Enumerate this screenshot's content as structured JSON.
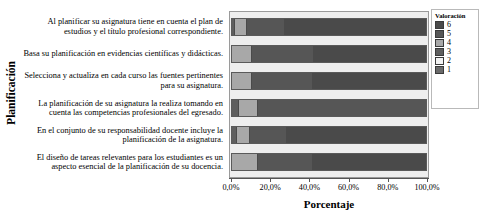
{
  "chart_data": {
    "type": "bar",
    "orientation": "horizontal",
    "stacked": true,
    "normalized": true,
    "title": "",
    "xlabel": "Porcentaje",
    "ylabel": "Planificación",
    "xlim": [
      0,
      100
    ],
    "xticks": [
      0,
      20,
      40,
      60,
      80,
      100
    ],
    "xticklabels": [
      "0,0%",
      "20,0%",
      "40,0%",
      "60,0%",
      "80,0%",
      "100,0%"
    ],
    "grid": false,
    "legend": {
      "title": "Valoración",
      "position": "right",
      "entries": [
        {
          "label": "6",
          "color": "#4a4a4a"
        },
        {
          "label": "5",
          "color": "#565656"
        },
        {
          "label": "4",
          "color": "#a8a8a8"
        },
        {
          "label": "3",
          "color": "#5e5e5e"
        },
        {
          "label": "2",
          "color": "#f2f2f2"
        },
        {
          "label": "1",
          "color": "#6a6a6a"
        }
      ]
    },
    "categories": [
      "Al planificar su asignatura tiene en cuenta el plan de estudios y el título profesional correspondiente.",
      "Basa su planificación en evidencias científicas y didácticas.",
      "Selecciona y actualiza en cada curso las fuentes pertinentes para su asignatura.",
      "La planificación de su asignatura la realiza tomando en cuenta las competencias profesionales del egresado.",
      "En el conjunto de su responsabilidad docente incluye la planificación de la asignatura.",
      "El diseño de tareas relevantes para los estudiantes es un aspecto esencial de la planificación de su docencia."
    ],
    "series": [
      {
        "name": "1",
        "color": "#6a6a6a",
        "values": [
          0.0,
          0.0,
          0.0,
          0.0,
          0.0,
          0.0
        ]
      },
      {
        "name": "2",
        "color": "#f2f2f2",
        "values": [
          0.0,
          0.0,
          0.0,
          0.0,
          0.0,
          0.0
        ]
      },
      {
        "name": "3",
        "color": "#5e5e5e",
        "values": [
          1.0,
          0.0,
          0.0,
          3.0,
          2.0,
          0.0
        ]
      },
      {
        "name": "4",
        "color": "#a8a8a8",
        "values": [
          6.0,
          10.0,
          10.0,
          10.0,
          7.0,
          13.0
        ]
      },
      {
        "name": "5",
        "color": "#565656",
        "values": [
          20.0,
          32.0,
          31.0,
          87.0,
          19.0,
          28.0
        ]
      },
      {
        "name": "6",
        "color": "#4a4a4a",
        "values": [
          73.0,
          58.0,
          59.0,
          0.0,
          72.0,
          59.0
        ]
      }
    ],
    "bar_segments": [
      [
        {
          "series": "3",
          "start": 0.0,
          "width": 1.0,
          "color": "#5e5e5e"
        },
        {
          "series": "4",
          "start": 1.0,
          "width": 6.0,
          "color": "#a8a8a8"
        },
        {
          "series": "5",
          "start": 7.0,
          "width": 20.0,
          "color": "#565656"
        },
        {
          "series": "6",
          "start": 27.0,
          "width": 73.0,
          "color": "#4a4a4a"
        }
      ],
      [
        {
          "series": "4",
          "start": 0.0,
          "width": 10.0,
          "color": "#a8a8a8"
        },
        {
          "series": "5",
          "start": 10.0,
          "width": 32.0,
          "color": "#565656"
        },
        {
          "series": "6",
          "start": 42.0,
          "width": 58.0,
          "color": "#4a4a4a"
        }
      ],
      [
        {
          "series": "4",
          "start": 0.0,
          "width": 10.0,
          "color": "#a8a8a8"
        },
        {
          "series": "5",
          "start": 10.0,
          "width": 31.0,
          "color": "#565656"
        },
        {
          "series": "6",
          "start": 41.0,
          "width": 59.0,
          "color": "#4a4a4a"
        }
      ],
      [
        {
          "series": "3",
          "start": 0.0,
          "width": 3.0,
          "color": "#5e5e5e"
        },
        {
          "series": "4",
          "start": 3.0,
          "width": 10.0,
          "color": "#a8a8a8"
        },
        {
          "series": "5",
          "start": 13.0,
          "width": 87.0,
          "color": "#565656"
        }
      ],
      [
        {
          "series": "3",
          "start": 0.0,
          "width": 2.0,
          "color": "#5e5e5e"
        },
        {
          "series": "4",
          "start": 2.0,
          "width": 7.0,
          "color": "#a8a8a8"
        },
        {
          "series": "5",
          "start": 9.0,
          "width": 19.0,
          "color": "#565656"
        },
        {
          "series": "6",
          "start": 28.0,
          "width": 72.0,
          "color": "#4a4a4a"
        }
      ],
      [
        {
          "series": "4",
          "start": 0.0,
          "width": 13.0,
          "color": "#a8a8a8"
        },
        {
          "series": "5",
          "start": 13.0,
          "width": 28.0,
          "color": "#565656"
        },
        {
          "series": "6",
          "start": 41.0,
          "width": 59.0,
          "color": "#4a4a4a"
        }
      ]
    ]
  },
  "colors": {
    "plot_background": "#eeeeee",
    "plot_border": "#9a9a9a",
    "axis": "#555555",
    "text": "#000000"
  }
}
